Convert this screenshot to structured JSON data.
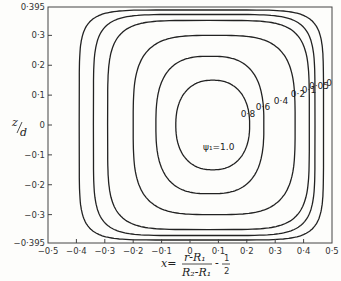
{
  "chart_data": {
    "type": "contour",
    "title": "",
    "xlabel": "x = (r - R1)/(R2 - R1) - 1/2",
    "xlabel_parts": {
      "lhs": "x=",
      "num": "r-R₁",
      "den": "R₂-R₁",
      "minus": "-",
      "half_num": "1",
      "half_den": "2"
    },
    "ylabel": "z/d",
    "ylabel_parts": {
      "num": "z",
      "den": "d"
    },
    "xlim": [
      -0.5,
      0.5
    ],
    "ylim": [
      -0.395,
      0.395
    ],
    "xticks": [
      "-0.5",
      "-0.4",
      "-0.3",
      "-0.2",
      "-0.1",
      "0",
      "0.1",
      "0.2",
      "0.3",
      "0.4",
      "0.5"
    ],
    "yticks": [
      "0.395",
      "0.3",
      "0.2",
      "0.1",
      "0",
      "-0.1",
      "-0.2",
      "-0.3",
      "-0.395"
    ],
    "grid": false,
    "center_label": "ψ₁=1.0",
    "center_point": {
      "x": 0.07,
      "y": 0.0
    },
    "contour_levels": [
      {
        "level": "0",
        "x_left": -0.5,
        "x_right": 0.5,
        "y_extent": 0.395
      },
      {
        "level": "0.05",
        "x_left": -0.39,
        "x_right": 0.47,
        "y_extent": 0.385
      },
      {
        "level": "0.1",
        "x_left": -0.34,
        "x_right": 0.44,
        "y_extent": 0.37
      },
      {
        "level": "0.2",
        "x_left": -0.29,
        "x_right": 0.42,
        "y_extent": 0.35
      },
      {
        "level": "0.4",
        "x_left": -0.2,
        "x_right": 0.37,
        "y_extent": 0.3
      },
      {
        "level": "0.6",
        "x_left": -0.12,
        "x_right": 0.26,
        "y_extent": 0.23
      },
      {
        "level": "0.8",
        "x_left": -0.05,
        "x_right": 0.21,
        "y_extent": 0.15
      }
    ]
  }
}
